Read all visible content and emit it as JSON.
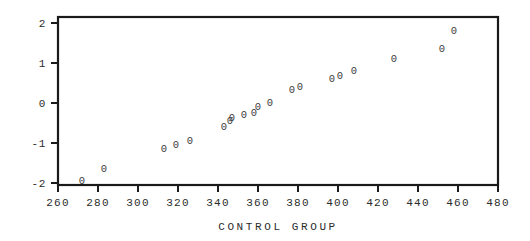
{
  "chart_data": {
    "type": "scatter",
    "title": "",
    "xlabel": "CONTROL GROUP",
    "ylabel": "",
    "xlim": [
      260,
      480
    ],
    "ylim": [
      -2.1,
      2.1
    ],
    "grid": false,
    "legend": null,
    "marker_glyph": "0",
    "xticks": [
      260,
      280,
      300,
      320,
      340,
      360,
      380,
      400,
      420,
      440,
      460,
      480
    ],
    "xtick_labels": [
      "260",
      "280",
      "300",
      "320",
      "340",
      "360",
      "380",
      "400",
      "420",
      "440",
      "460",
      "480"
    ],
    "yticks": [
      -2,
      -1,
      0,
      1,
      2
    ],
    "ytick_labels": [
      "-2",
      "-1",
      "0",
      "1",
      "2"
    ],
    "series": [
      {
        "name": "control group normal probability plot",
        "points": [
          {
            "x": 272,
            "y": -1.92
          },
          {
            "x": 283,
            "y": -1.62
          },
          {
            "x": 313,
            "y": -1.12
          },
          {
            "x": 319,
            "y": -1.02
          },
          {
            "x": 326,
            "y": -0.92
          },
          {
            "x": 343,
            "y": -0.58
          },
          {
            "x": 346,
            "y": -0.42
          },
          {
            "x": 347,
            "y": -0.35
          },
          {
            "x": 353,
            "y": -0.28
          },
          {
            "x": 358,
            "y": -0.22
          },
          {
            "x": 360,
            "y": -0.08
          },
          {
            "x": 366,
            "y": 0.02
          },
          {
            "x": 377,
            "y": 0.35
          },
          {
            "x": 381,
            "y": 0.42
          },
          {
            "x": 397,
            "y": 0.62
          },
          {
            "x": 401,
            "y": 0.7
          },
          {
            "x": 408,
            "y": 0.82
          },
          {
            "x": 428,
            "y": 1.12
          },
          {
            "x": 452,
            "y": 1.38
          },
          {
            "x": 458,
            "y": 1.82
          }
        ]
      }
    ]
  },
  "figure": {
    "background_color": "#ffffff",
    "axis_color": "#1a1a1a",
    "marker_color": "#3a3a3a",
    "text_color": "#2b2b2b"
  }
}
